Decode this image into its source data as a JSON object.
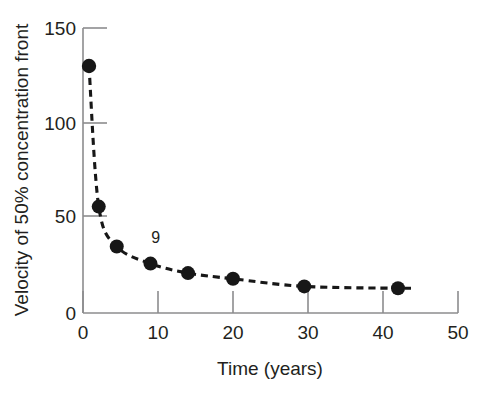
{
  "chart_data": {
    "type": "scatter",
    "title": "",
    "xlabel": "Time (years)",
    "ylabel": "Velocity of 50% concentration front",
    "xlim": [
      0,
      50
    ],
    "ylim": [
      0,
      150
    ],
    "xticks": [
      0,
      10,
      20,
      30,
      40,
      50
    ],
    "xtick_labels": [
      "0",
      "10",
      "20",
      "30",
      "40",
      "50"
    ],
    "yticks": [
      0,
      50,
      100,
      150
    ],
    "ytick_labels": [
      "0",
      "50",
      "100",
      "150"
    ],
    "grid": false,
    "legend": null,
    "marker": "filled-circle",
    "line_style": "dashed",
    "series": [
      {
        "name": "Velocity of 50% concentration front",
        "x": [
          0.8,
          2.1,
          4.5,
          9,
          14,
          20,
          29.5,
          42
        ],
        "values": [
          130,
          56,
          35,
          26,
          21,
          18,
          14,
          13
        ]
      }
    ],
    "annotations": [
      {
        "text": "9",
        "x": 9.7,
        "y": 37
      }
    ]
  },
  "axes": {
    "x_title": "Time (years)",
    "y_title": "Velocity of 50% concentration front"
  },
  "colors": {
    "marker": "#171717",
    "line": "#171717",
    "axis": "#8c8c8e",
    "text": "#231f20",
    "background": "#ffffff"
  }
}
